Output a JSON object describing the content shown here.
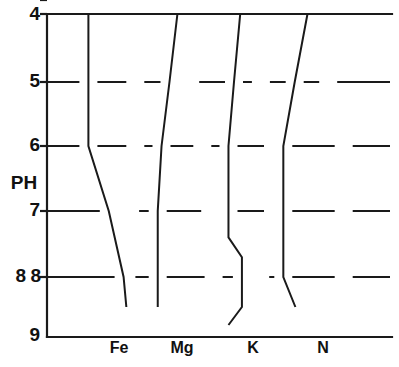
{
  "chart_data": {
    "type": "area",
    "title": "",
    "subtitle": "",
    "xlabel": "",
    "ylabel": "PH",
    "ylim": [
      4,
      9
    ],
    "xlim": [
      0,
      100
    ],
    "y_inverted": true,
    "grid": true,
    "legend": false,
    "legend_position": "none",
    "y_ticks": [
      {
        "value": 4,
        "label": "4"
      },
      {
        "value": 5,
        "label": "5"
      },
      {
        "value": 6,
        "label": "6"
      },
      {
        "value": 7,
        "label": "7"
      },
      {
        "value": 8,
        "label": "8"
      },
      {
        "value": 9,
        "label": "9"
      }
    ],
    "y_tick_duplicate": {
      "value": 8,
      "label": "8"
    },
    "categories": [
      "Fe",
      "Mg",
      "K",
      "N"
    ],
    "x_ticks": [
      {
        "label": "Fe",
        "x": 29.5
      },
      {
        "label": "Mg",
        "x": 47.0
      },
      {
        "label": "K",
        "x": 67.0
      },
      {
        "label": "N",
        "x": 86.5
      }
    ],
    "series": [
      {
        "name": "Fe",
        "points": [
          {
            "ph": 4.0,
            "left": 12.0,
            "right": 25.6
          },
          {
            "ph": 5.0,
            "left": 12.0,
            "right": 25.6
          },
          {
            "ph": 6.0,
            "left": 12.0,
            "right": 25.6
          },
          {
            "ph": 7.0,
            "left": 17.9,
            "right": 24.1
          },
          {
            "ph": 8.0,
            "left": 22.2,
            "right": 23.0
          },
          {
            "ph": 8.5,
            "left": 23.0,
            "right": 22.8
          },
          {
            "ph": 9.0,
            "left": 23.0,
            "right": 20.5
          }
        ]
      },
      {
        "name": "Mg",
        "points": [
          {
            "ph": 4.0,
            "left": 37.8,
            "right": 38.9
          },
          {
            "ph": 5.0,
            "left": 35.5,
            "right": 41.5
          },
          {
            "ph": 6.0,
            "left": 33.2,
            "right": 45.0
          },
          {
            "ph": 7.0,
            "left": 32.1,
            "right": 47.3
          },
          {
            "ph": 8.0,
            "left": 32.1,
            "right": 48.3
          },
          {
            "ph": 8.5,
            "left": 32.1,
            "right": 48.3
          },
          {
            "ph": 9.0,
            "left": 35.5,
            "right": 46.0
          }
        ]
      },
      {
        "name": "K",
        "points": [
          {
            "ph": 4.0,
            "left": 56.0,
            "right": 58.0
          },
          {
            "ph": 5.0,
            "left": 54.2,
            "right": 62.0
          },
          {
            "ph": 6.0,
            "left": 52.6,
            "right": 65.5
          },
          {
            "ph": 7.0,
            "left": 52.6,
            "right": 65.5
          },
          {
            "ph": 7.4,
            "left": 52.6,
            "right": 65.5
          },
          {
            "ph": 7.7,
            "left": 56.5,
            "right": 61.8
          },
          {
            "ph": 8.5,
            "left": 56.5,
            "right": 61.8
          },
          {
            "ph": 8.8,
            "left": 52.6,
            "right": 65.5
          },
          {
            "ph": 9.0,
            "left": 55.9,
            "right": 66.8
          }
        ]
      },
      {
        "name": "N",
        "points": [
          {
            "ph": 4.0,
            "left": 75.5,
            "right": 76.5
          },
          {
            "ph": 5.0,
            "left": 71.8,
            "right": 81.5
          },
          {
            "ph": 6.0,
            "left": 68.5,
            "right": 86.0
          },
          {
            "ph": 7.0,
            "left": 68.5,
            "right": 86.0
          },
          {
            "ph": 8.0,
            "left": 68.5,
            "right": 86.0
          },
          {
            "ph": 8.5,
            "left": 72.0,
            "right": 84.0
          },
          {
            "ph": 9.0,
            "left": 77.0,
            "right": 82.0
          }
        ]
      }
    ],
    "colors": {
      "line": "#1a1a1a",
      "background": "#ffffff",
      "grid": "#1a1a1a"
    }
  }
}
